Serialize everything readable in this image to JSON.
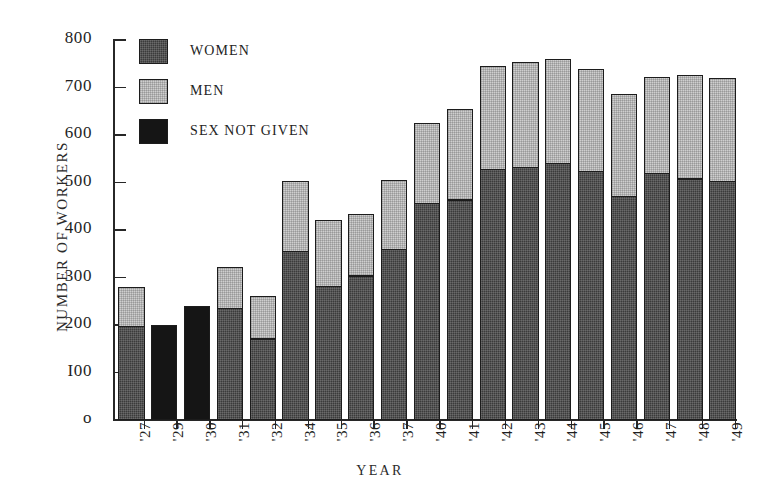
{
  "chart_data": {
    "type": "bar",
    "subtype": "stacked-vertical",
    "title": "",
    "xlabel": "YEAR",
    "ylabel": "NUMBER OF WORKERS",
    "ylim": [
      0,
      800
    ],
    "y_ticks": [
      0,
      100,
      200,
      300,
      400,
      500,
      600,
      700,
      800
    ],
    "y_tick_labels": [
      "o",
      "I00",
      "200",
      "300",
      "400",
      "500",
      "600",
      "700",
      "800"
    ],
    "grid": false,
    "legend_position": "inside-top-left",
    "categories": [
      "'27",
      "'29",
      "'30",
      "'31",
      "'32",
      "'34",
      "'35",
      "'36",
      "'37",
      "'40",
      "'41",
      "'42",
      "'43",
      "'44",
      "'45",
      "'46",
      "'47",
      "'48",
      "'49"
    ],
    "series": [
      {
        "name": "WOMEN",
        "color": "#3b3b3b",
        "values": [
          193,
          0,
          0,
          232,
          167,
          352,
          277,
          300,
          355,
          452,
          460,
          524,
          528,
          536,
          520,
          467,
          516,
          504,
          499
        ]
      },
      {
        "name": "MEN",
        "color": "#cfcfcf",
        "values": [
          87,
          0,
          0,
          90,
          95,
          152,
          145,
          133,
          150,
          174,
          194,
          222,
          226,
          224,
          220,
          220,
          206,
          222,
          222
        ]
      },
      {
        "name": "SEX NOT GIVEN",
        "color": "#151515",
        "values": [
          0,
          200,
          240,
          0,
          0,
          0,
          0,
          0,
          0,
          0,
          0,
          0,
          0,
          0,
          0,
          0,
          0,
          0,
          0
        ]
      }
    ],
    "totals": [
      280,
      200,
      240,
      322,
      262,
      504,
      422,
      433,
      505,
      626,
      654,
      746,
      754,
      760,
      740,
      687,
      722,
      726,
      721
    ]
  },
  "legend": {
    "items": [
      {
        "label": "WOMEN",
        "swatch": "women-swatch"
      },
      {
        "label": "MEN",
        "swatch": "men-swatch"
      },
      {
        "label": "SEX NOT GIVEN",
        "swatch": "sex-not-given-swatch"
      }
    ]
  },
  "axes": {
    "y_title": "NUMBER OF WORKERS",
    "x_title": "YEAR"
  }
}
